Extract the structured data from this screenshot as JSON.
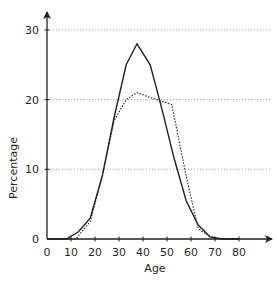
{
  "chart_data": {
    "type": "line",
    "title": "",
    "xlabel": "Age",
    "ylabel": "Percentage",
    "xlim": [
      0,
      90
    ],
    "ylim": [
      0,
      32
    ],
    "x_ticks": [
      0,
      10,
      20,
      30,
      40,
      50,
      60,
      70,
      80
    ],
    "y_ticks": [
      0,
      10,
      20,
      30
    ],
    "grid": {
      "horizontal_dotted_at": [
        10,
        20,
        30
      ]
    },
    "legend": null,
    "series": [
      {
        "name": "solid",
        "style": "solid",
        "color": "#231f20",
        "points": [
          [
            0,
            0
          ],
          [
            8,
            0
          ],
          [
            13,
            1
          ],
          [
            18,
            3
          ],
          [
            23,
            9
          ],
          [
            28,
            17.5
          ],
          [
            33,
            25
          ],
          [
            37.5,
            28
          ],
          [
            43,
            25
          ],
          [
            48,
            18.5
          ],
          [
            53,
            11.5
          ],
          [
            58,
            5.5
          ],
          [
            63,
            2
          ],
          [
            68,
            0.3
          ],
          [
            73,
            0
          ],
          [
            80,
            0
          ]
        ]
      },
      {
        "name": "dotted",
        "style": "dotted",
        "color": "#231f20",
        "points": [
          [
            0,
            0
          ],
          [
            12,
            0
          ],
          [
            18,
            2.5
          ],
          [
            23,
            9
          ],
          [
            28,
            17
          ],
          [
            33,
            20
          ],
          [
            37.5,
            21
          ],
          [
            43,
            20.3
          ],
          [
            52,
            19.3
          ],
          [
            58,
            9
          ],
          [
            63,
            1.5
          ],
          [
            68,
            0.3
          ],
          [
            73,
            0
          ],
          [
            80,
            0
          ]
        ]
      }
    ]
  },
  "colors": {
    "axis": "#231f20",
    "grid": "#8a8a8a",
    "background": "#ffffff"
  }
}
